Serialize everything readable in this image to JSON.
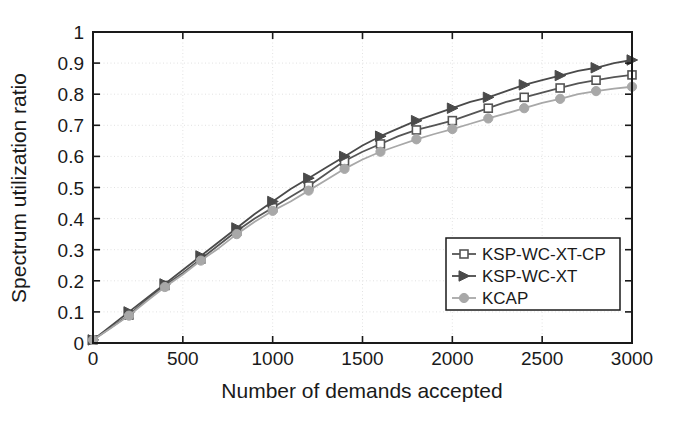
{
  "chart_data": {
    "type": "line",
    "title": "",
    "xlabel": "Number of demands accepted",
    "ylabel": "Spectrum utilization ratio",
    "xlim": [
      0,
      3000
    ],
    "ylim": [
      0,
      1
    ],
    "xticks": [
      0,
      500,
      1000,
      1500,
      2000,
      2500,
      3000
    ],
    "yticks": [
      0,
      0.1,
      0.2,
      0.3,
      0.4,
      0.5,
      0.6,
      0.7,
      0.8,
      0.9,
      1
    ],
    "xtick_labels": [
      "0",
      "500",
      "1000",
      "1500",
      "2000",
      "2500",
      "3000"
    ],
    "ytick_labels": [
      "0",
      "0.1",
      "0.2",
      "0.3",
      "0.4",
      "0.5",
      "0.6",
      "0.7",
      "0.8",
      "0.9",
      "1"
    ],
    "grid": true,
    "legend_position": "lower right",
    "x": [
      0,
      100,
      200,
      300,
      400,
      500,
      600,
      700,
      800,
      900,
      1000,
      1100,
      1200,
      1300,
      1400,
      1500,
      1600,
      1700,
      1800,
      1900,
      2000,
      2100,
      2200,
      2300,
      2400,
      2500,
      2600,
      2700,
      2800,
      2900,
      3000
    ],
    "series": [
      {
        "name": "KSP-WC-XT-CP",
        "marker": "square-open",
        "color": "#555555",
        "values": [
          0.01,
          0.05,
          0.09,
          0.14,
          0.185,
          0.225,
          0.27,
          0.315,
          0.36,
          0.4,
          0.435,
          0.47,
          0.505,
          0.545,
          0.585,
          0.615,
          0.64,
          0.665,
          0.685,
          0.7,
          0.715,
          0.735,
          0.755,
          0.775,
          0.79,
          0.805,
          0.82,
          0.835,
          0.845,
          0.855,
          0.862
        ]
      },
      {
        "name": "KSP-WC-XT",
        "marker": "triangle-right",
        "color": "#4a4a4a",
        "values": [
          0.01,
          0.055,
          0.1,
          0.145,
          0.19,
          0.235,
          0.28,
          0.325,
          0.37,
          0.415,
          0.455,
          0.495,
          0.53,
          0.565,
          0.6,
          0.635,
          0.665,
          0.69,
          0.715,
          0.735,
          0.755,
          0.775,
          0.79,
          0.81,
          0.83,
          0.845,
          0.86,
          0.875,
          0.885,
          0.9,
          0.91
        ]
      },
      {
        "name": "KCAP",
        "marker": "circle-filled",
        "color": "#a8a8a8",
        "values": [
          0.01,
          0.048,
          0.088,
          0.135,
          0.18,
          0.22,
          0.265,
          0.305,
          0.35,
          0.39,
          0.425,
          0.455,
          0.49,
          0.525,
          0.56,
          0.59,
          0.615,
          0.635,
          0.655,
          0.672,
          0.688,
          0.705,
          0.722,
          0.738,
          0.755,
          0.772,
          0.785,
          0.8,
          0.81,
          0.818,
          0.824
        ]
      }
    ]
  },
  "legend": {
    "entries": [
      {
        "label": "KSP-WC-XT-CP"
      },
      {
        "label": "KSP-WC-XT"
      },
      {
        "label": "KCAP"
      }
    ]
  },
  "colors": {
    "axis": "#1a1a1a",
    "grid": "#e2e2e2",
    "background": "#ffffff",
    "series_cp": "#555555",
    "series_xt": "#4a4a4a",
    "series_kcap": "#a8a8a8"
  }
}
